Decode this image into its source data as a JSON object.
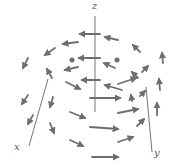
{
  "figure": {
    "axis_labels": {
      "x": "x",
      "y": "y",
      "z": "z"
    },
    "colors": {
      "axis": "#666666",
      "arrow": "#6e6e6e",
      "background": "#ffffff"
    },
    "axes": {
      "origin": [
        95,
        112
      ],
      "z": {
        "from": [
          95,
          112
        ],
        "to": [
          95,
          16
        ]
      },
      "x": {
        "from": [
          48,
          79
        ],
        "to": [
          29,
          146
        ]
      },
      "y": {
        "from": [
          146,
          87
        ],
        "to": [
          152,
          152
        ]
      }
    },
    "arrows": [
      {
        "x1": 100,
        "y1": 34,
        "x2": 80,
        "y2": 34
      },
      {
        "x1": 78,
        "y1": 42,
        "x2": 63,
        "y2": 44
      },
      {
        "x1": 118,
        "y1": 40,
        "x2": 105,
        "y2": 37
      },
      {
        "x1": 55,
        "y1": 48,
        "x2": 45,
        "y2": 55
      },
      {
        "x1": 140,
        "y1": 52,
        "x2": 133,
        "y2": 45
      },
      {
        "x1": 163,
        "y1": 63,
        "x2": 162,
        "y2": 53
      },
      {
        "x1": 28,
        "y1": 58,
        "x2": 23,
        "y2": 68
      },
      {
        "x1": 100,
        "y1": 58,
        "x2": 79,
        "y2": 58
      },
      {
        "x1": 72,
        "y1": 60,
        "x2": 72,
        "y2": 60
      },
      {
        "x1": 117,
        "y1": 60,
        "x2": 117,
        "y2": 60
      },
      {
        "x1": 78,
        "y1": 67,
        "x2": 65,
        "y2": 70
      },
      {
        "x1": 115,
        "y1": 68,
        "x2": 104,
        "y2": 63
      },
      {
        "x1": 142,
        "y1": 72,
        "x2": 148,
        "y2": 66
      },
      {
        "x1": 52,
        "y1": 78,
        "x2": 47,
        "y2": 69
      },
      {
        "x1": 138,
        "y1": 78,
        "x2": 132,
        "y2": 72
      },
      {
        "x1": 100,
        "y1": 80,
        "x2": 82,
        "y2": 80
      },
      {
        "x1": 118,
        "y1": 84,
        "x2": 136,
        "y2": 78
      },
      {
        "x1": 66,
        "y1": 82,
        "x2": 80,
        "y2": 89
      },
      {
        "x1": 160,
        "y1": 90,
        "x2": 159,
        "y2": 79
      },
      {
        "x1": 28,
        "y1": 95,
        "x2": 22,
        "y2": 104
      },
      {
        "x1": 122,
        "y1": 90,
        "x2": 105,
        "y2": 85
      },
      {
        "x1": 90,
        "y1": 98,
        "x2": 120,
        "y2": 98
      },
      {
        "x1": 140,
        "y1": 96,
        "x2": 145,
        "y2": 91
      },
      {
        "x1": 118,
        "y1": 113,
        "x2": 138,
        "y2": 109
      },
      {
        "x1": 53,
        "y1": 97,
        "x2": 50,
        "y2": 107
      },
      {
        "x1": 132,
        "y1": 101,
        "x2": 131,
        "y2": 95
      },
      {
        "x1": 157,
        "y1": 115,
        "x2": 157,
        "y2": 103
      },
      {
        "x1": 33,
        "y1": 115,
        "x2": 28,
        "y2": 124
      },
      {
        "x1": 70,
        "y1": 112,
        "x2": 85,
        "y2": 118
      },
      {
        "x1": 137,
        "y1": 126,
        "x2": 144,
        "y2": 119
      },
      {
        "x1": 90,
        "y1": 127,
        "x2": 118,
        "y2": 129
      },
      {
        "x1": 50,
        "y1": 123,
        "x2": 54,
        "y2": 133
      },
      {
        "x1": 118,
        "y1": 142,
        "x2": 133,
        "y2": 137
      },
      {
        "x1": 70,
        "y1": 140,
        "x2": 83,
        "y2": 146
      },
      {
        "x1": 92,
        "y1": 157,
        "x2": 118,
        "y2": 157
      }
    ]
  }
}
